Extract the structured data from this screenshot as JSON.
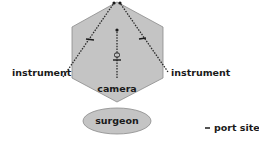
{
  "diagram": {
    "labels": {
      "instrument_left": "instrument",
      "instrument_right": "instrument",
      "camera": "camera",
      "surgeon": "surgeon",
      "legend_port_site": "port site",
      "legend_marker": "–"
    },
    "colors": {
      "hexagon_fill": "#c4c4c4",
      "hexagon_stroke": "#8a8a8a",
      "ellipse_fill": "#c4c4c4",
      "ellipse_stroke": "#8a8a8a",
      "line": "#2a2a2a",
      "text": "#1a1a1a"
    },
    "elements": {
      "working_area": "hexagon",
      "surgeon_position": "ellipse",
      "instrument_paths": 2,
      "camera_path": 1,
      "port_site_markers": 3
    }
  }
}
